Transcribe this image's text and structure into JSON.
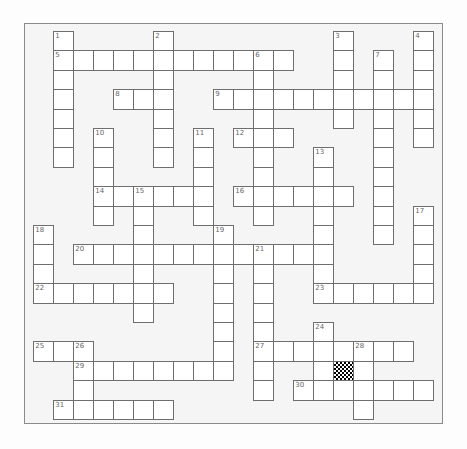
{
  "puzzle": {
    "type": "crossword",
    "grid": {
      "cols": 21,
      "rows": 20,
      "origin_x": 33.3,
      "origin_y": 31,
      "cell_w": 20,
      "cell_h": 19.4
    },
    "entries": [
      {
        "number": "1",
        "dir": "down",
        "col": 1,
        "row": 0,
        "length": 7
      },
      {
        "number": "2",
        "dir": "down",
        "col": 6,
        "row": 0,
        "length": 7
      },
      {
        "number": "3",
        "dir": "down",
        "col": 15,
        "row": 0,
        "length": 5
      },
      {
        "number": "4",
        "dir": "down",
        "col": 19,
        "row": 0,
        "length": 6
      },
      {
        "number": "5",
        "dir": "across",
        "col": 1,
        "row": 1,
        "length": 12
      },
      {
        "number": "6",
        "dir": "down",
        "col": 11,
        "row": 1,
        "length": 9
      },
      {
        "number": "7",
        "dir": "down",
        "col": 17,
        "row": 1,
        "length": 10
      },
      {
        "number": "8",
        "dir": "across",
        "col": 4,
        "row": 3,
        "length": 3
      },
      {
        "number": "9",
        "dir": "across",
        "col": 9,
        "row": 3,
        "length": 11
      },
      {
        "number": "10",
        "dir": "down",
        "col": 3,
        "row": 5,
        "length": 5
      },
      {
        "number": "11",
        "dir": "down",
        "col": 8,
        "row": 5,
        "length": 5
      },
      {
        "number": "12",
        "dir": "across",
        "col": 10,
        "row": 5,
        "length": 3
      },
      {
        "number": "13",
        "dir": "down",
        "col": 14,
        "row": 6,
        "length": 8
      },
      {
        "number": "14",
        "dir": "across",
        "col": 3,
        "row": 8,
        "length": 6
      },
      {
        "number": "15",
        "dir": "down",
        "col": 5,
        "row": 8,
        "length": 7
      },
      {
        "number": "16",
        "dir": "across",
        "col": 10,
        "row": 8,
        "length": 6
      },
      {
        "number": "17",
        "dir": "down",
        "col": 19,
        "row": 9,
        "length": 5
      },
      {
        "number": "18",
        "dir": "down",
        "col": 0,
        "row": 10,
        "length": 4
      },
      {
        "number": "19",
        "dir": "down",
        "col": 9,
        "row": 10,
        "length": 8
      },
      {
        "number": "20",
        "dir": "across",
        "col": 2,
        "row": 11,
        "length": 13
      },
      {
        "number": "21",
        "dir": "down",
        "col": 11,
        "row": 11,
        "length": 8
      },
      {
        "number": "22",
        "dir": "across",
        "col": 0,
        "row": 13,
        "length": 7
      },
      {
        "number": "23",
        "dir": "across",
        "col": 14,
        "row": 13,
        "length": 6
      },
      {
        "number": "24",
        "dir": "down",
        "col": 14,
        "row": 15,
        "length": 4
      },
      {
        "number": "25",
        "dir": "across",
        "col": 0,
        "row": 16,
        "length": 3
      },
      {
        "number": "26",
        "dir": "down",
        "col": 2,
        "row": 16,
        "length": 4
      },
      {
        "number": "27",
        "dir": "across",
        "col": 11,
        "row": 16,
        "length": 8
      },
      {
        "number": "28",
        "dir": "down",
        "col": 16,
        "row": 16,
        "length": 4
      },
      {
        "number": "29",
        "dir": "across",
        "col": 2,
        "row": 17,
        "length": 8
      },
      {
        "number": "30",
        "dir": "across",
        "col": 13,
        "row": 18,
        "length": 7
      },
      {
        "number": "31",
        "dir": "across",
        "col": 1,
        "row": 19,
        "length": 6
      }
    ],
    "blocked_cells": [
      {
        "col": 15,
        "row": 17,
        "style": "checker"
      }
    ]
  }
}
